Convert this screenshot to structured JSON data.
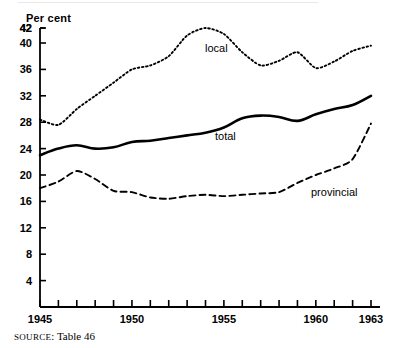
{
  "axis": {
    "y_title": "Per cent",
    "y_ticks": [
      42,
      40,
      36,
      32,
      28,
      24,
      20,
      16,
      12,
      8,
      4
    ],
    "x_tick_labels": [
      "1945",
      "1950",
      "1955",
      "1960",
      "1963"
    ]
  },
  "labels": {
    "local": "local",
    "total": "total",
    "provincial": "provincial"
  },
  "source": {
    "prefix": "SOURCE",
    "text": ": Table 46"
  },
  "chart_data": {
    "type": "line",
    "title": "",
    "subtitle": "",
    "xlabel": "",
    "ylabel": "Per cent",
    "xlim": [
      1945,
      1963
    ],
    "ylim": [
      0,
      42
    ],
    "grid": false,
    "legend": "inline-annotations",
    "yticks": [
      4,
      8,
      12,
      16,
      20,
      24,
      28,
      32,
      36,
      40,
      42
    ],
    "xticks": [
      1945,
      1946,
      1947,
      1948,
      1949,
      1950,
      1951,
      1952,
      1953,
      1954,
      1955,
      1956,
      1957,
      1958,
      1959,
      1960,
      1961,
      1962,
      1963
    ],
    "xtick_labels_shown": [
      1945,
      1950,
      1955,
      1960,
      1963
    ],
    "x": [
      1945,
      1946,
      1947,
      1948,
      1949,
      1950,
      1951,
      1952,
      1953,
      1954,
      1955,
      1956,
      1957,
      1958,
      1959,
      1960,
      1961,
      1962,
      1963
    ],
    "series": [
      {
        "name": "local",
        "style": "dotted",
        "values": [
          28.4,
          27.6,
          30.0,
          32.0,
          34.0,
          36.0,
          36.6,
          38.0,
          41.0,
          42.0,
          41.2,
          38.6,
          36.6,
          37.3,
          38.6,
          36.2,
          37.2,
          38.8,
          39.6
        ]
      },
      {
        "name": "total",
        "style": "solid",
        "values": [
          23.0,
          24.0,
          24.5,
          24.0,
          24.2,
          25.0,
          25.2,
          25.6,
          26.0,
          26.4,
          27.2,
          28.6,
          29.0,
          28.8,
          28.2,
          29.2,
          30.0,
          30.6,
          32.0
        ]
      },
      {
        "name": "provincial",
        "style": "dashed",
        "values": [
          18.0,
          19.0,
          20.6,
          19.4,
          17.6,
          17.4,
          16.6,
          16.4,
          16.8,
          17.0,
          16.8,
          17.0,
          17.2,
          17.4,
          18.8,
          20.0,
          21.0,
          22.4,
          27.8
        ]
      }
    ]
  }
}
